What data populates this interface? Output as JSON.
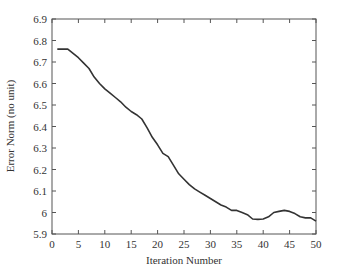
{
  "chart_data": {
    "type": "line",
    "title": "",
    "xlabel": "Iteration Number",
    "ylabel": "Error Norm (no unit)",
    "xlim": [
      0,
      50
    ],
    "ylim": [
      5.9,
      6.9
    ],
    "xticks": [
      0,
      5,
      10,
      15,
      20,
      25,
      30,
      35,
      40,
      45,
      50
    ],
    "yticks": [
      5.9,
      6,
      6.1,
      6.2,
      6.3,
      6.4,
      6.5,
      6.6,
      6.7,
      6.8,
      6.9
    ],
    "ytick_labels": [
      "5.9",
      "6",
      "6.1",
      "6.2",
      "6.3",
      "6.4",
      "6.5",
      "6.6",
      "6.7",
      "6.8",
      "6.9"
    ],
    "grid": false,
    "legend": null,
    "series": [
      {
        "name": "Error Norm",
        "color": "#333333",
        "x": [
          1,
          2,
          3,
          4,
          5,
          6,
          7,
          8,
          9,
          10,
          11,
          12,
          13,
          14,
          15,
          16,
          17,
          18,
          19,
          20,
          21,
          22,
          23,
          24,
          25,
          26,
          27,
          28,
          29,
          30,
          31,
          32,
          33,
          34,
          35,
          36,
          37,
          38,
          39,
          40,
          41,
          42,
          43,
          44,
          45,
          46,
          47,
          48,
          49,
          50
        ],
        "values": [
          6.76,
          6.76,
          6.76,
          6.74,
          6.72,
          6.695,
          6.67,
          6.63,
          6.6,
          6.575,
          6.555,
          6.535,
          6.515,
          6.49,
          6.47,
          6.455,
          6.435,
          6.395,
          6.35,
          6.315,
          6.275,
          6.26,
          6.22,
          6.18,
          6.155,
          6.13,
          6.11,
          6.095,
          6.08,
          6.065,
          6.05,
          6.035,
          6.025,
          6.01,
          6.01,
          6.0,
          5.99,
          5.97,
          5.968,
          5.97,
          5.98,
          6.0,
          6.005,
          6.01,
          6.005,
          5.995,
          5.98,
          5.975,
          5.975,
          5.96
        ]
      }
    ]
  }
}
